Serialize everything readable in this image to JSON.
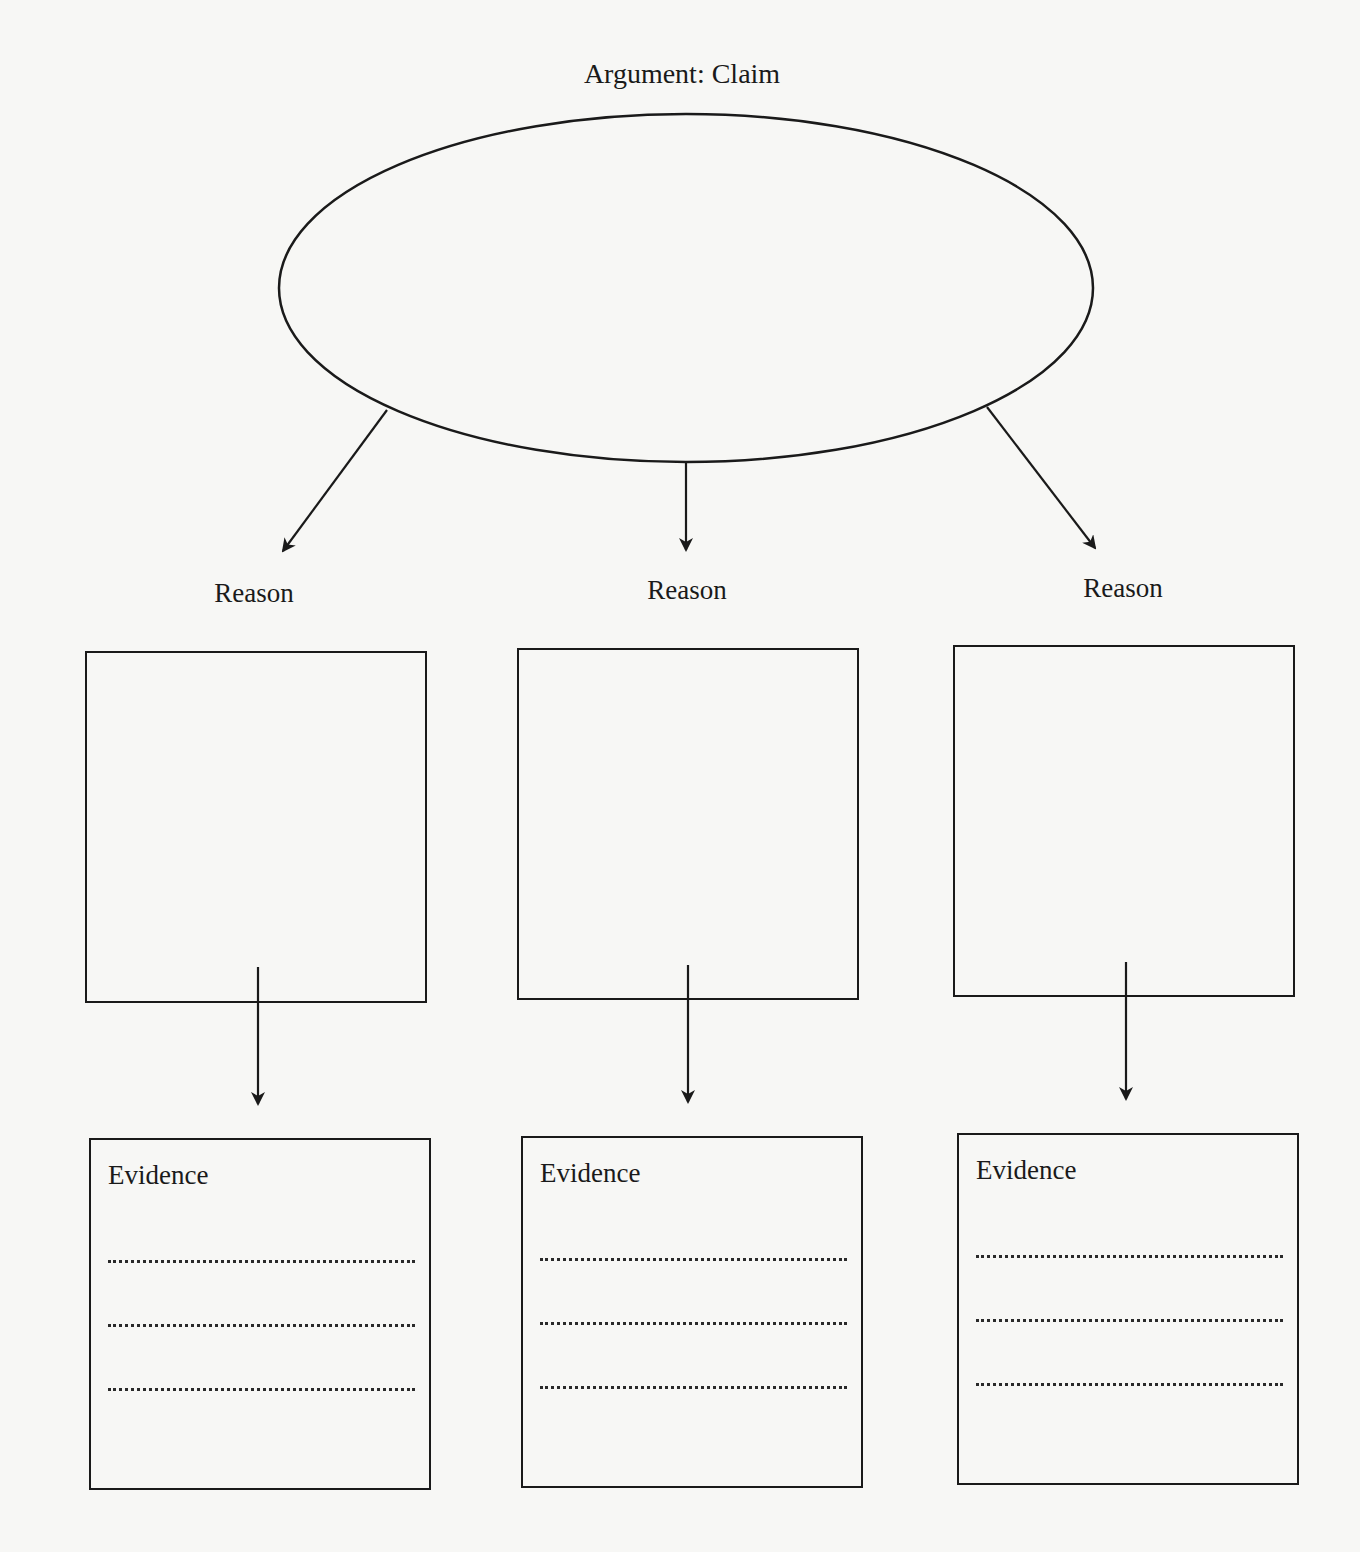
{
  "diagram": {
    "title": "Argument: Claim",
    "claim_shape": "ellipse",
    "columns": [
      {
        "reason_label": "Reason",
        "evidence_label": "Evidence",
        "evidence_lines": 3
      },
      {
        "reason_label": "Reason",
        "evidence_label": "Evidence",
        "evidence_lines": 3
      },
      {
        "reason_label": "Reason",
        "evidence_label": "Evidence",
        "evidence_lines": 3
      }
    ],
    "stroke_color": "#1a1a1a",
    "background_color": "#f7f7f5"
  }
}
